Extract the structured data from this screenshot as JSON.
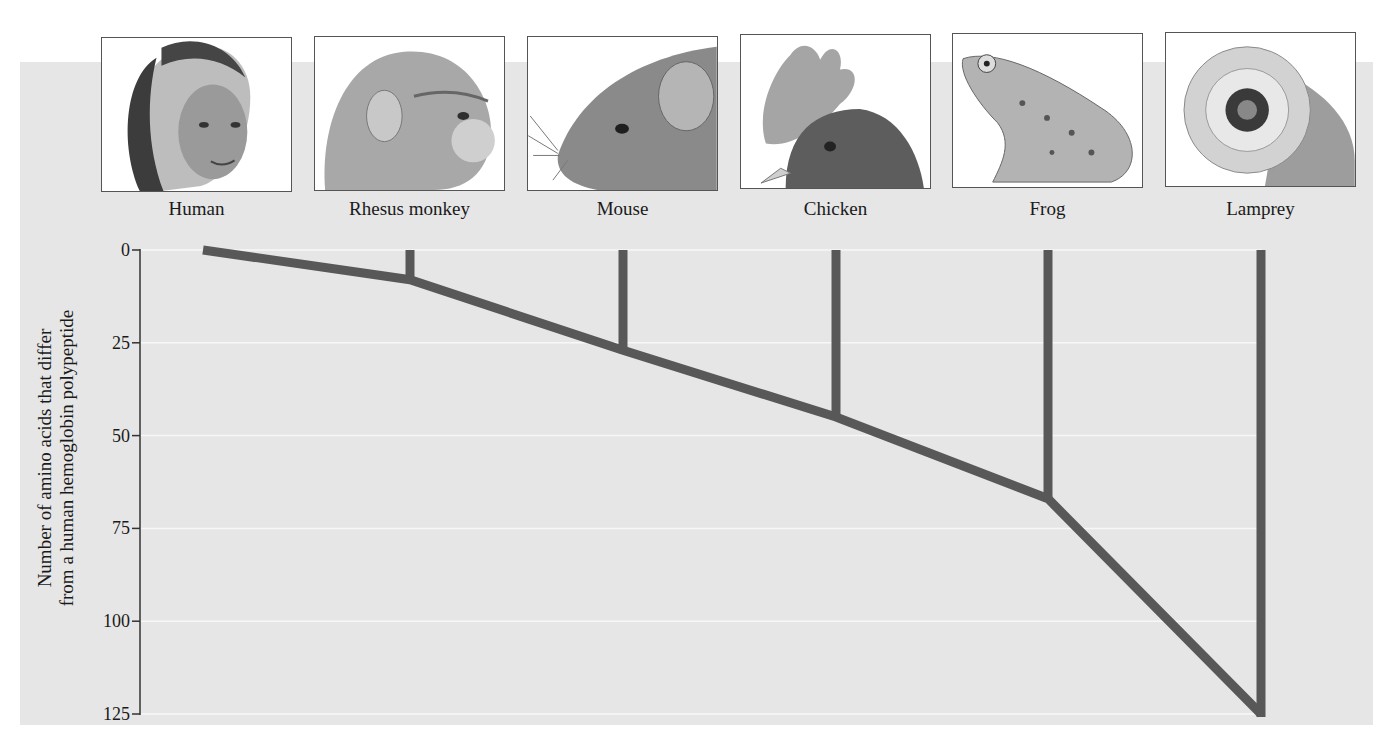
{
  "chart_data": {
    "type": "tree",
    "title": "",
    "ylabel": "Number of amino acids that differ from a human hemoglobin polypeptide",
    "ylabel_lines": [
      "Number of amino acids that differ",
      "from a human hemoglobin polypeptide"
    ],
    "xlabel": "",
    "ylim": [
      0,
      125
    ],
    "y_inverted": true,
    "yticks": [
      0,
      25,
      50,
      75,
      100,
      125
    ],
    "grid": true,
    "categories": [
      "Human",
      "Rhesus monkey",
      "Mouse",
      "Chicken",
      "Frog",
      "Lamprey"
    ],
    "values": [
      0,
      8,
      27,
      45,
      67,
      125
    ],
    "colors": {
      "background": "#e6e6e6",
      "branch": "#585858",
      "grid": "#f7f7f7",
      "axis": "#333333"
    }
  },
  "organisms": [
    {
      "name": "Human",
      "icon": "human-portrait-icon"
    },
    {
      "name": "Rhesus monkey",
      "icon": "rhesus-monkey-portrait-icon"
    },
    {
      "name": "Mouse",
      "icon": "mouse-portrait-icon"
    },
    {
      "name": "Chicken",
      "icon": "chicken-portrait-icon"
    },
    {
      "name": "Frog",
      "icon": "frog-portrait-icon"
    },
    {
      "name": "Lamprey",
      "icon": "lamprey-portrait-icon"
    }
  ],
  "axis": {
    "ticks": [
      "0",
      "25",
      "50",
      "75",
      "100",
      "125"
    ],
    "label_line1": "Number of amino acids that differ",
    "label_line2": "from a human hemoglobin polypeptide"
  }
}
